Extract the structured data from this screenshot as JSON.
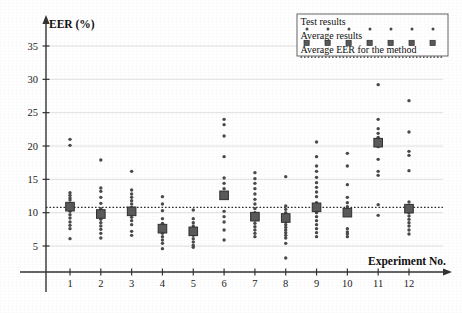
{
  "chart_data": {
    "type": "scatter",
    "title": "",
    "xlabel": "Experiment No.",
    "ylabel": "EER (%)",
    "xlim": [
      0.3,
      12.9
    ],
    "ylim": [
      0,
      38
    ],
    "yticks": [
      5,
      10,
      15,
      20,
      25,
      30,
      35
    ],
    "xticks": [
      1,
      2,
      3,
      4,
      5,
      6,
      7,
      8,
      9,
      10,
      11,
      12
    ],
    "categories": [
      "1",
      "2",
      "3",
      "4",
      "5",
      "6",
      "7",
      "8",
      "9",
      "10",
      "11",
      "12"
    ],
    "grid": true,
    "legend_position": "top-right",
    "overall_average_eer": 10.8,
    "series": [
      {
        "name": "Test results",
        "marker": "dot",
        "color": "#444444",
        "points_by_experiment": [
          {
            "x": 1,
            "values": [
              21.0,
              20.1,
              13.0,
              12.6,
              12.2,
              11.9,
              11.4,
              10.8,
              10.2,
              9.7,
              9.2,
              8.6,
              8.1,
              7.6,
              6.1
            ]
          },
          {
            "x": 2,
            "values": [
              17.9,
              13.7,
              13.2,
              12.3,
              11.4,
              10.6,
              10.0,
              9.5,
              9.0,
              8.5,
              8.0,
              7.5,
              6.9,
              6.2
            ]
          },
          {
            "x": 3,
            "values": [
              16.2,
              13.4,
              12.8,
              12.3,
              11.8,
              11.3,
              10.8,
              10.3,
              9.8,
              9.3,
              8.8,
              8.2,
              7.2,
              6.6
            ]
          },
          {
            "x": 4,
            "values": [
              12.4,
              11.3,
              10.3,
              9.1,
              8.4,
              7.9,
              7.4,
              6.9,
              6.4,
              5.9,
              5.4,
              4.6
            ]
          },
          {
            "x": 5,
            "values": [
              10.4,
              9.1,
              8.5,
              8.0,
              7.5,
              7.0,
              6.6,
              6.1,
              5.6,
              5.1,
              4.8
            ]
          },
          {
            "x": 6,
            "values": [
              24.0,
              23.2,
              21.5,
              18.4,
              15.2,
              14.4,
              13.6,
              12.9,
              12.4,
              10.2,
              9.4,
              8.6,
              7.4,
              5.9
            ]
          },
          {
            "x": 7,
            "values": [
              16.0,
              15.1,
              14.4,
              13.6,
              12.8,
              12.0,
              11.3,
              10.6,
              10.0,
              9.4,
              8.9,
              8.4,
              7.9,
              7.4,
              6.9,
              6.4
            ]
          },
          {
            "x": 8,
            "values": [
              15.4,
              11.0,
              10.5,
              10.0,
              9.5,
              9.0,
              8.6,
              8.2,
              7.8,
              7.4,
              7.0,
              6.6,
              6.2,
              5.4,
              3.2
            ]
          },
          {
            "x": 9,
            "values": [
              20.6,
              18.4,
              17.0,
              16.2,
              15.3,
              14.5,
              13.8,
              13.1,
              12.4,
              11.5,
              10.7,
              10.0,
              9.4,
              8.8,
              8.2,
              7.6,
              7.0,
              6.4
            ]
          },
          {
            "x": 10,
            "values": [
              18.9,
              17.0,
              14.2,
              12.3,
              11.5,
              10.9,
              10.4,
              9.9,
              7.6,
              7.1,
              6.8,
              6.4
            ]
          },
          {
            "x": 11,
            "values": [
              29.2,
              24.0,
              22.6,
              21.9,
              21.3,
              20.8,
              20.4,
              19.9,
              18.0,
              16.2,
              15.6,
              11.2,
              9.6
            ]
          },
          {
            "x": 12,
            "values": [
              26.8,
              22.1,
              19.2,
              18.6,
              16.3,
              11.6,
              11.0,
              10.5,
              10.0,
              9.5,
              9.0,
              8.5,
              8.0,
              7.4,
              6.8
            ]
          }
        ]
      },
      {
        "name": "Average results",
        "marker": "square",
        "color": "#555555",
        "x": [
          1,
          2,
          3,
          4,
          5,
          6,
          7,
          8,
          9,
          10,
          11,
          12
        ],
        "values": [
          10.9,
          9.8,
          10.2,
          7.6,
          7.2,
          12.6,
          9.4,
          9.2,
          10.8,
          10.0,
          20.5,
          10.6
        ]
      },
      {
        "name": "Average EER for the method",
        "marker": "dotted-line",
        "color": "#333333",
        "value": 10.8
      }
    ]
  },
  "axes": {
    "y_axis_title": "EER (%)",
    "x_axis_title": "Experiment No.",
    "y_tick_labels": [
      "5",
      "10",
      "15",
      "20",
      "25",
      "30",
      "35"
    ],
    "x_tick_labels": [
      "1",
      "2",
      "3",
      "4",
      "5",
      "6",
      "7",
      "8",
      "9",
      "10",
      "11",
      "12"
    ]
  },
  "legend": {
    "items": [
      {
        "label": "Test results",
        "marker": "dot"
      },
      {
        "label": "Average results",
        "marker": "square"
      },
      {
        "label": "Average EER for the method",
        "marker": "dotted-line"
      }
    ]
  },
  "style": {
    "axis_color": "#333333",
    "grid_color": "#d8d8d8",
    "dot_color": "#4a4a4a",
    "square_color": "#5a5a5a",
    "avg_line_color": "#2f2f2f",
    "legend_border_color": "#555555",
    "background": "#ffffff"
  }
}
